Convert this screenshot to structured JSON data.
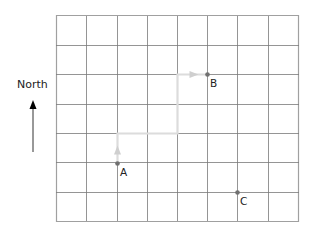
{
  "diagram": {
    "type": "grid-map",
    "grid": {
      "columns": 8,
      "rows": 7,
      "x_lines": [
        56,
        86,
        117,
        147,
        177,
        207,
        237,
        268,
        298
      ],
      "y_lines": [
        15,
        45,
        74,
        104,
        133,
        162,
        192,
        221
      ],
      "line_color": "#7a7a7a",
      "border_color": "#a0a0a0"
    },
    "compass": {
      "label": "North",
      "direction": "up",
      "arrow_color": "#000000"
    },
    "points": [
      {
        "id": "A",
        "label": "A",
        "x": 117,
        "y": 163,
        "label_x": 120,
        "label_y": 167
      },
      {
        "id": "B",
        "label": "B",
        "x": 207,
        "y": 74,
        "label_x": 210,
        "label_y": 78
      },
      {
        "id": "C",
        "label": "C",
        "x": 237,
        "y": 192,
        "label_x": 240,
        "label_y": 196
      }
    ],
    "point_color": "#707070",
    "path": {
      "from": "A",
      "to": "B",
      "color": "#dcdcdc",
      "waypoints": [
        [
          117,
          163
        ],
        [
          117,
          133
        ],
        [
          177,
          133
        ],
        [
          177,
          74
        ],
        [
          207,
          74
        ]
      ],
      "arrows": [
        {
          "x": 117,
          "y": 150,
          "direction": "up"
        },
        {
          "x": 193,
          "y": 74,
          "direction": "right"
        }
      ]
    }
  }
}
